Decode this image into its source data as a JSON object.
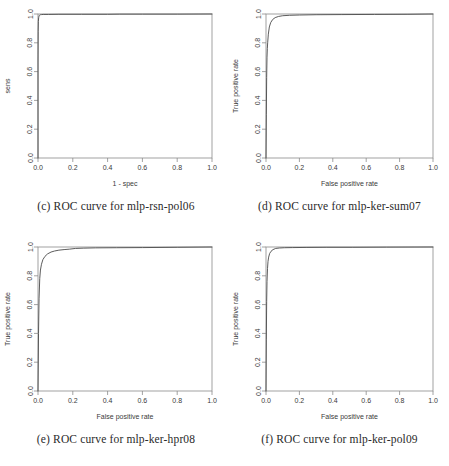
{
  "figure": {
    "panel_count": 4,
    "background": "#ffffff",
    "curve_color": "#4a4a4a",
    "axis_color": "#8a8a8a"
  },
  "panels": [
    {
      "key": "c",
      "caption": "(c) ROC curve for mlp-rsn-pol06",
      "chart_data": {
        "type": "line",
        "title": "",
        "xlabel": "1 - spec",
        "ylabel": "sens",
        "xlim": [
          0,
          1
        ],
        "ylim": [
          0,
          1
        ],
        "grid": false,
        "legend": "none",
        "xticks": [
          "0.0",
          "0.2",
          "0.4",
          "0.6",
          "0.8",
          "1.0"
        ],
        "xtick_values": [
          0.0,
          0.2,
          0.4,
          0.6,
          0.8,
          1.0
        ],
        "yticks": [
          "0.0",
          "0.2",
          "0.4",
          "0.6",
          "0.8",
          "1.0"
        ],
        "ytick_values": [
          0.0,
          0.2,
          0.4,
          0.6,
          0.8,
          1.0
        ],
        "series": [
          {
            "name": "ROC mlp-rsn-pol06",
            "x": [
              0.0,
              0.0,
              0.001,
              0.002,
              0.004,
              0.006,
              0.008,
              0.01,
              0.014,
              0.02,
              0.03,
              0.06,
              0.12,
              0.25,
              0.4,
              0.47,
              0.6,
              0.8,
              1.0
            ],
            "y": [
              0.0,
              0.66,
              0.88,
              0.948,
              0.975,
              0.985,
              0.99,
              0.993,
              0.995,
              0.996,
              0.997,
              0.997,
              0.998,
              0.998,
              0.998,
              0.999,
              0.999,
              0.999,
              1.0
            ]
          }
        ]
      }
    },
    {
      "key": "d",
      "caption": "(d) ROC curve for mlp-ker-sum07",
      "chart_data": {
        "type": "line",
        "title": "",
        "xlabel": "False positive rate",
        "ylabel": "True positive rate",
        "xlim": [
          0,
          1
        ],
        "ylim": [
          0,
          1
        ],
        "grid": false,
        "legend": "none",
        "xticks": [
          "0.0",
          "0.2",
          "0.4",
          "0.6",
          "0.8",
          "1.0"
        ],
        "xtick_values": [
          0.0,
          0.2,
          0.4,
          0.6,
          0.8,
          1.0
        ],
        "yticks": [
          "0.0",
          "0.2",
          "0.4",
          "0.6",
          "0.8",
          "1.0"
        ],
        "ytick_values": [
          0.0,
          0.2,
          0.4,
          0.6,
          0.8,
          1.0
        ],
        "series": [
          {
            "name": "ROC mlp-ker-sum07",
            "x": [
              0.0,
              0.002,
              0.004,
              0.006,
              0.008,
              0.01,
              0.014,
              0.02,
              0.028,
              0.04,
              0.055,
              0.075,
              0.1,
              0.14,
              0.2,
              0.3,
              0.45,
              0.65,
              0.85,
              1.0
            ],
            "y": [
              0.0,
              0.3,
              0.56,
              0.7,
              0.76,
              0.8,
              0.86,
              0.91,
              0.94,
              0.962,
              0.975,
              0.983,
              0.988,
              0.991,
              0.993,
              0.995,
              0.996,
              0.997,
              0.998,
              1.0
            ]
          }
        ]
      }
    },
    {
      "key": "e",
      "caption": "(e) ROC curve for mlp-ker-hpr08",
      "chart_data": {
        "type": "line",
        "title": "",
        "xlabel": "False positive rate",
        "ylabel": "True positive rate",
        "xlim": [
          0,
          1
        ],
        "ylim": [
          0,
          1
        ],
        "grid": false,
        "legend": "none",
        "xticks": [
          "0.0",
          "0.2",
          "0.4",
          "0.6",
          "0.8",
          "1.0"
        ],
        "xtick_values": [
          0.0,
          0.2,
          0.4,
          0.6,
          0.8,
          1.0
        ],
        "yticks": [
          "0.0",
          "0.2",
          "0.4",
          "0.6",
          "0.8",
          "1.0"
        ],
        "ytick_values": [
          0.0,
          0.2,
          0.4,
          0.6,
          0.8,
          1.0
        ],
        "series": [
          {
            "name": "ROC mlp-ker-hpr08",
            "x": [
              0.0,
              0.003,
              0.006,
              0.01,
              0.014,
              0.02,
              0.028,
              0.04,
              0.055,
              0.075,
              0.095,
              0.12,
              0.15,
              0.18,
              0.215,
              0.26,
              0.33,
              0.45,
              0.6,
              0.8,
              1.0
            ],
            "y": [
              0.0,
              0.4,
              0.64,
              0.78,
              0.84,
              0.88,
              0.912,
              0.935,
              0.952,
              0.965,
              0.972,
              0.978,
              0.982,
              0.985,
              0.99,
              0.992,
              0.994,
              0.995,
              0.996,
              0.998,
              1.0
            ]
          }
        ]
      }
    },
    {
      "key": "f",
      "caption": "(f) ROC curve for mlp-ker-pol09",
      "chart_data": {
        "type": "line",
        "title": "",
        "xlabel": "False positive rate",
        "ylabel": "True positive rate",
        "xlim": [
          0,
          1
        ],
        "ylim": [
          0,
          1
        ],
        "grid": false,
        "legend": "none",
        "xticks": [
          "0.0",
          "0.2",
          "0.4",
          "0.6",
          "0.8",
          "1.0"
        ],
        "xtick_values": [
          0.0,
          0.2,
          0.4,
          0.6,
          0.8,
          1.0
        ],
        "yticks": [
          "0.0",
          "0.2",
          "0.4",
          "0.6",
          "0.8",
          "1.0"
        ],
        "ytick_values": [
          0.0,
          0.2,
          0.4,
          0.6,
          0.8,
          1.0
        ],
        "series": [
          {
            "name": "ROC mlp-ker-pol09",
            "x": [
              0.0,
              0.002,
              0.004,
              0.006,
              0.009,
              0.012,
              0.016,
              0.022,
              0.03,
              0.042,
              0.058,
              0.08,
              0.11,
              0.16,
              0.24,
              0.36,
              0.52,
              0.72,
              1.0
            ],
            "y": [
              0.0,
              0.36,
              0.62,
              0.76,
              0.85,
              0.9,
              0.93,
              0.955,
              0.97,
              0.982,
              0.99,
              0.993,
              0.995,
              0.996,
              0.997,
              0.998,
              0.998,
              0.999,
              1.0
            ]
          }
        ]
      }
    }
  ]
}
